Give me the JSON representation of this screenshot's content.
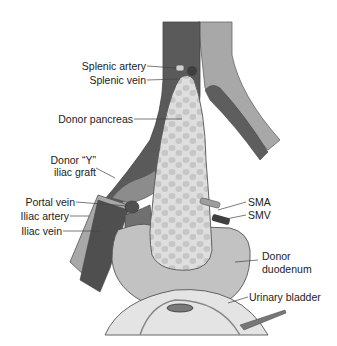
{
  "diagram": {
    "colors": {
      "vein_dark": "#5a5a5a",
      "artery_light": "#a8a8a8",
      "pancreas": "#dedede",
      "pancreas_spots": "#c4c4c4",
      "duodenum": "#c2c2c2",
      "bladder": "#e4e4e4",
      "outline": "#555555",
      "label_line": "#444444"
    },
    "labels": {
      "splenic_artery": "Splenic artery",
      "splenic_vein": "Splenic vein",
      "donor_pancreas": "Donor pancreas",
      "donor_y_graft_line1": "Donor “Y”",
      "donor_y_graft_line2": "iliac graft",
      "portal_vein": "Portal vein",
      "iliac_artery": "Iliac artery",
      "iliac_vein": "Iliac vein",
      "sma": "SMA",
      "smv": "SMV",
      "donor_duodenum_line1": "Donor",
      "donor_duodenum_line2": "duodenum",
      "urinary_bladder": "Urinary bladder"
    }
  }
}
